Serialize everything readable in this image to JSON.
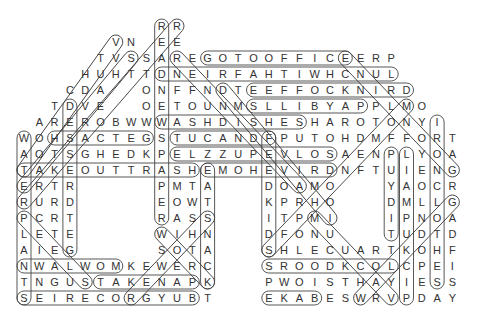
{
  "puzzle": {
    "type": "word search",
    "columns": 29,
    "rows": 18,
    "origin_x": 24,
    "origin_y": 26,
    "step_x": 15.3,
    "step_y": 16,
    "text_color": "#333333",
    "line_color": "#444444",
    "grid_rows": [
      {
        "start": 9,
        "letters": "RR"
      },
      {
        "start": 6,
        "letters": "VN.EE"
      },
      {
        "start": 5,
        "letters": "TVSSAREGOTOOFFICEERP"
      },
      {
        "start": 4,
        "letters": "HUHTTDNEIRFAHTIWHCNUL"
      },
      {
        "start": 3,
        "letters": "CDA..ONFFNDTEEFFOCKNIRD"
      },
      {
        "start": 2,
        "letters": "TDVE..OETOUNMSLLIBYAPPLMO"
      },
      {
        "start": 1,
        "letters": "AREROBWWWASHDISHESHAROTONYI"
      },
      {
        "start": 0,
        "letters": "WOHSACTEGSTUCANDFPUTOHDMFFORT"
      },
      {
        "start": 0,
        "letters": "AOTSGHEDKPELZZUPEVLOSAENPLYOA"
      },
      {
        "start": 0,
        "letters": "TAKEOUTTRASHEMOHEVIRDNFTUIENG"
      },
      {
        "start": 0,
        "letters": "ERTR.....PMTA...DOAMO...YAOCR"
      },
      {
        "start": 0,
        "letters": "RURD.....EOWT...KPRHO...DMLLG"
      },
      {
        "start": 0,
        "letters": "PCRT.....RASS...ITPMI...IPNOA"
      },
      {
        "start": 0,
        "letters": "LETE.....WIHN...DFONU...TUDTD"
      },
      {
        "start": 0,
        "letters": "AIEG.....SOTA...SHLECUARTKOHF"
      },
      {
        "start": 0,
        "letters": "NWALWOMKEWERC...SROODKCOLCPEI"
      },
      {
        "start": 0,
        "letters": "TNGUSTAKENAPK...PWOISTHAYIESS"
      },
      {
        "start": 0,
        "letters": "SEIRECORGYUBT...EKABESWRVPDAY"
      }
    ],
    "found_words": [
      {
        "word": "GOTOOFFICE",
        "from": [
          2,
          12
        ],
        "to": [
          2,
          21
        ]
      },
      {
        "word": "DNEIRFAHTIWHCNUL",
        "from": [
          3,
          9
        ],
        "to": [
          3,
          24
        ]
      },
      {
        "word": "EEFFOCKNIRD",
        "from": [
          4,
          15
        ],
        "to": [
          4,
          25
        ]
      },
      {
        "word": "SLLIBYAP",
        "from": [
          5,
          15
        ],
        "to": [
          5,
          22
        ]
      },
      {
        "word": "WASHDISHES",
        "from": [
          6,
          9
        ],
        "to": [
          6,
          18
        ]
      },
      {
        "word": "HSACTEG",
        "from": [
          7,
          2
        ],
        "to": [
          7,
          8
        ]
      },
      {
        "word": "TUCANDF",
        "from": [
          7,
          10
        ],
        "to": [
          7,
          16
        ]
      },
      {
        "word": "ELZZUPEVLOS",
        "from": [
          8,
          10
        ],
        "to": [
          8,
          20
        ]
      },
      {
        "word": "TAKEOUTTRASH",
        "from": [
          9,
          0
        ],
        "to": [
          9,
          11
        ]
      },
      {
        "word": "EMOHEVIRD",
        "from": [
          9,
          12
        ],
        "to": [
          9,
          20
        ]
      },
      {
        "word": "NWALWOM",
        "from": [
          15,
          0
        ],
        "to": [
          15,
          6
        ]
      },
      {
        "word": "SROODKCOL",
        "from": [
          15,
          16
        ],
        "to": [
          15,
          24
        ]
      },
      {
        "word": "TAKENAP",
        "from": [
          16,
          5
        ],
        "to": [
          16,
          11
        ]
      },
      {
        "word": "SEIRECORGYUB",
        "from": [
          17,
          0
        ],
        "to": [
          17,
          11
        ]
      },
      {
        "word": "EKAB",
        "from": [
          17,
          16
        ],
        "to": [
          17,
          19
        ]
      },
      {
        "word": "READNEWSPAPER",
        "from": [
          0,
          9
        ],
        "to": [
          12,
          9
        ]
      },
      {
        "word": "WATERPLANTS",
        "from": [
          7,
          0
        ],
        "to": [
          17,
          0
        ]
      },
      {
        "word": "DERSEE",
        "from": [
          5,
          3
        ],
        "to": [
          14,
          3
        ]
      },
      {
        "word": "EATSNACK",
        "from": [
          9,
          12
        ],
        "to": [
          16,
          12
        ]
      },
      {
        "word": "FEEDKIDS",
        "from": [
          7,
          16
        ],
        "to": [
          14,
          16
        ]
      },
      {
        "word": "PUYDIT",
        "from": [
          8,
          24
        ],
        "to": [
          13,
          24
        ]
      },
      {
        "word": "LIAMPUKCIP",
        "from": [
          8,
          25
        ],
        "to": [
          17,
          25
        ]
      },
      {
        "word": "IRONCLOTHES",
        "from": [
          6,
          27
        ],
        "to": [
          16,
          27
        ]
      },
      {
        "word": "diag-1",
        "from": [
          1,
          6
        ],
        "to": [
          9,
          0
        ]
      },
      {
        "word": "diag-2",
        "from": [
          2,
          7
        ],
        "to": [
          10,
          0
        ]
      },
      {
        "word": "diag-3",
        "from": [
          0,
          10
        ],
        "to": [
          11,
          0
        ]
      },
      {
        "word": "diag-4",
        "from": [
          2,
          10
        ],
        "to": [
          10,
          18
        ]
      },
      {
        "word": "diag-5",
        "from": [
          4,
          13
        ],
        "to": [
          12,
          20
        ]
      },
      {
        "word": "diag-6",
        "from": [
          2,
          21
        ],
        "to": [
          9,
          28
        ]
      },
      {
        "word": "diag-7",
        "from": [
          5,
          25
        ],
        "to": [
          14,
          16
        ]
      },
      {
        "word": "diag-8",
        "from": [
          12,
          12
        ],
        "to": [
          17,
          7
        ]
      },
      {
        "word": "diag-9",
        "from": [
          13,
          9
        ],
        "to": [
          16,
          12
        ]
      },
      {
        "word": "diag-10",
        "from": [
          11,
          28
        ],
        "to": [
          17,
          22
        ]
      },
      {
        "word": "diag-11",
        "from": [
          12,
          19
        ],
        "to": [
          17,
          24
        ]
      },
      {
        "word": "diag-12",
        "from": [
          12,
          0
        ],
        "to": [
          16,
          4
        ]
      }
    ]
  }
}
